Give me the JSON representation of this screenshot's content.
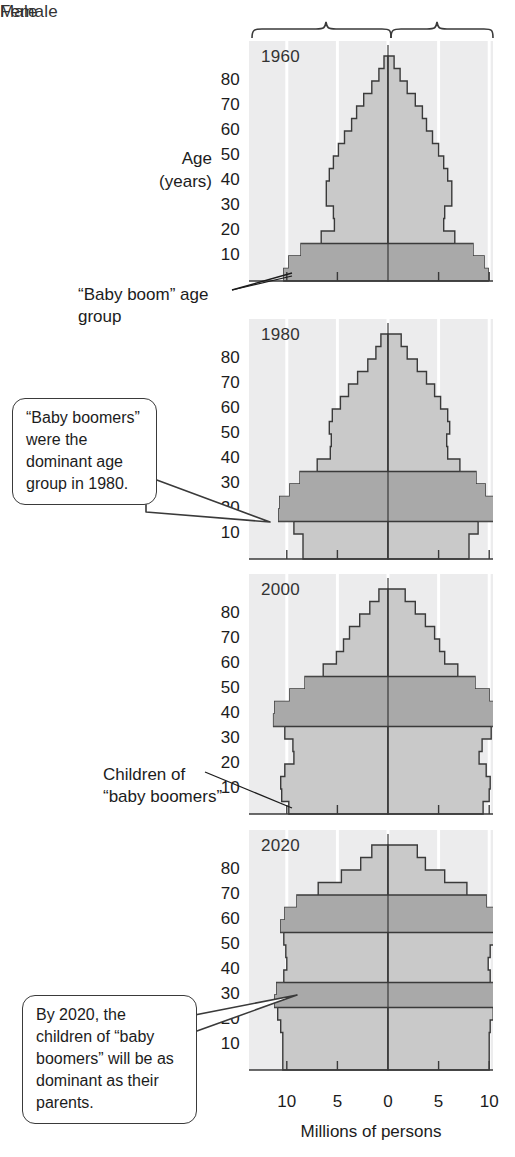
{
  "header": {
    "male_label": "Male",
    "female_label": "Female"
  },
  "axes": {
    "y_title_line1": "Age",
    "y_title_line2": "(years)",
    "y_ticks": [
      "80",
      "70",
      "60",
      "50",
      "40",
      "30",
      "20",
      "10"
    ],
    "x_title": "Millions of persons",
    "x_ticks": [
      "10",
      "5",
      "0",
      "5",
      "10"
    ]
  },
  "annotations": {
    "baby_boom_group": "“Baby boom” age group",
    "children_of_boomers": "Children of “baby boomers”",
    "callout_1980": "“Baby boomers” were the dominant age group in 1980.",
    "callout_2020": "By 2020, the children of “baby boomers” will be as dominant as their parents."
  },
  "colors": {
    "plot_background": "#ececed",
    "gridline": "#ffffff",
    "population_light": "#c9c9c9",
    "population_dark": "#a9a9a9",
    "outline": "#3a3a3a",
    "axis": "#3a3a3a",
    "text": "#1c1c1c"
  },
  "chart_data": {
    "type": "bar",
    "xlabel": "Millions of persons",
    "ylabel": "Age (years)",
    "xlim": [
      -12.5,
      12.5
    ],
    "ylim": [
      0,
      90
    ],
    "x_ticks": [
      -10,
      -5,
      0,
      5,
      10
    ],
    "y_ticks": [
      10,
      20,
      30,
      40,
      50,
      60,
      70,
      80
    ],
    "grid": true,
    "legend": [
      "Male",
      "Female"
    ],
    "orientation": "horizontal-pyramid",
    "age_bins": [
      "0-4",
      "5-9",
      "10-14",
      "15-19",
      "20-24",
      "25-29",
      "30-34",
      "35-39",
      "40-44",
      "45-49",
      "50-54",
      "55-59",
      "60-64",
      "65-69",
      "70-74",
      "75-79",
      "80-84",
      "85+"
    ],
    "panels": [
      {
        "year": "1960",
        "highlight_bins": [
          "0-4",
          "5-9",
          "10-14"
        ],
        "male": [
          10.3,
          9.8,
          8.6,
          6.6,
          5.3,
          5.4,
          6.1,
          6.1,
          5.8,
          5.4,
          4.9,
          4.3,
          3.6,
          3.1,
          2.4,
          1.6,
          0.9,
          0.4
        ],
        "female": [
          9.9,
          9.5,
          8.4,
          6.6,
          5.5,
          5.6,
          6.3,
          6.3,
          5.9,
          5.5,
          5.0,
          4.4,
          3.8,
          3.4,
          2.7,
          1.9,
          1.2,
          0.6
        ]
      },
      {
        "year": "1980",
        "highlight_bins": [
          "15-19",
          "20-24",
          "25-29",
          "30-34"
        ],
        "male": [
          8.4,
          8.4,
          9.3,
          10.8,
          10.7,
          9.7,
          8.7,
          7.0,
          5.7,
          5.6,
          5.8,
          5.5,
          4.7,
          3.9,
          3.0,
          2.0,
          1.2,
          0.7
        ],
        "female": [
          8.0,
          8.0,
          8.9,
          10.4,
          10.5,
          9.6,
          8.7,
          7.1,
          5.9,
          5.8,
          6.1,
          5.9,
          5.2,
          4.6,
          3.8,
          2.9,
          1.9,
          1.3
        ]
      },
      {
        "year": "2000",
        "highlight_bins": [
          "35-39",
          "40-44",
          "45-49",
          "50-54"
        ],
        "male": [
          9.8,
          10.5,
          10.6,
          10.2,
          9.3,
          9.4,
          10.2,
          11.3,
          11.2,
          9.7,
          8.2,
          6.4,
          5.1,
          4.4,
          3.8,
          2.8,
          1.8,
          0.9
        ],
        "female": [
          9.4,
          10.0,
          10.1,
          9.7,
          9.0,
          9.3,
          10.2,
          11.4,
          11.4,
          10.0,
          8.6,
          6.9,
          5.6,
          5.1,
          4.6,
          3.7,
          2.7,
          1.7
        ]
      },
      {
        "year": "2020",
        "highlight_bins": [
          "25-29",
          "30-34",
          "55-59",
          "60-64",
          "65-69"
        ],
        "male": [
          10.4,
          10.4,
          10.4,
          10.6,
          10.9,
          11.2,
          11.0,
          10.3,
          10.0,
          10.1,
          10.3,
          10.6,
          10.2,
          9.0,
          6.9,
          4.6,
          2.7,
          1.6
        ],
        "female": [
          10.0,
          10.0,
          10.0,
          10.1,
          10.4,
          10.8,
          10.7,
          10.1,
          9.9,
          10.1,
          10.5,
          10.9,
          10.7,
          9.7,
          7.8,
          5.6,
          3.7,
          2.9
        ]
      }
    ]
  }
}
